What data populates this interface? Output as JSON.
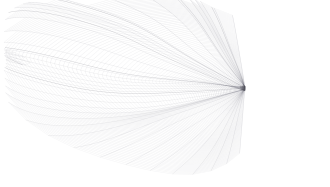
{
  "figure": {
    "title": "Crumpled Wireframe Mesh Surface",
    "kind": "3d-wireframe-mesh-render",
    "background_color": "#ffffff",
    "line_color": "#8c8c97",
    "line_color_dark": "#55555f",
    "line_color_light": "#c3c3cc",
    "line_width": 0.35,
    "canvas_width": 330,
    "canvas_height": 187
  },
  "chart_data": {
    "type": "line",
    "title": "Crumpled Wireframe Mesh Surface",
    "xlabel": "",
    "ylabel": "",
    "grid": false,
    "legend": "none",
    "xlim": [
      0,
      330
    ],
    "ylim": [
      0,
      187
    ],
    "render_style": "wireframe-quad-grid",
    "grid_resolution": {
      "u_divisions": 104,
      "v_divisions": 74
    },
    "surface_extent": {
      "x_min": 10,
      "x_max": 322,
      "y_min": 4,
      "y_max": 172
    },
    "features": [
      {
        "name": "radial-singularity-hub",
        "center_x": 245,
        "center_y": 88,
        "radius": 13,
        "description": "Concentric compressed ring where all mesh isolines converge",
        "density": "very-high"
      },
      {
        "name": "pointed-fold-tip",
        "center_x": 16,
        "center_y": 52,
        "description": "Sharp pinched fold at the left extremity of the sheet",
        "density": "low"
      },
      {
        "name": "dense-stipple-band",
        "center_x": 168,
        "center_y": 24,
        "description": "Upper centre band where grid cells compress to dots",
        "density": "high"
      },
      {
        "name": "smooth-relief-basin",
        "center_x": 112,
        "center_y": 78,
        "description": "Broad lighter basin with widely spaced isolines",
        "density": "low"
      },
      {
        "name": "lower-pleat-fan",
        "center_x": 180,
        "center_y": 138,
        "description": "Lower pleated fan of ridges sweeping left-down from the hub",
        "density": "medium"
      },
      {
        "name": "right-petal-fan",
        "center_x": 292,
        "center_y": 96,
        "description": "Radial petal lobes fanning right from the hub",
        "density": "medium"
      }
    ],
    "series": [
      {
        "name": "u-isolines",
        "count": 105,
        "color": "#8c8c97",
        "description": "Isolines running outward from the hub across the sheet"
      },
      {
        "name": "v-isolines",
        "count": 75,
        "color": "#8c8c97",
        "description": "Isolines running circumferentially around the hub"
      }
    ],
    "radial_lobes": {
      "count": 7,
      "amplitudes": [
        0.34,
        0.22,
        0.41,
        0.27,
        0.19,
        0.31,
        0.24
      ],
      "phases": [
        0.0,
        0.9,
        1.8,
        2.6,
        3.5,
        4.4,
        5.3
      ]
    },
    "fold_ridges": {
      "count": 9,
      "angles_deg": [
        168,
        196,
        212,
        228,
        244,
        262,
        288,
        312,
        340
      ]
    }
  }
}
